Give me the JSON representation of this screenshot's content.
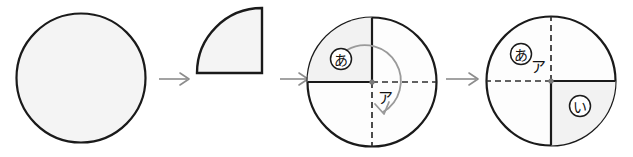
{
  "figure": {
    "background_color": "#ffffff",
    "stroke_color": "#1a1a1a",
    "dash_color": "#3a3a3a",
    "arrow_color": "#8c8c8c",
    "fill_shaded": "#f2f2f2",
    "fill_plain": "#fdfdfd"
  },
  "steps": [
    {
      "id": "step-1",
      "name": "full-circle",
      "shape": "circle",
      "shaded": true,
      "labels": []
    },
    {
      "id": "step-2",
      "name": "quarter-circle",
      "shape": "quarter-circle",
      "shaded": true,
      "corner": "bottom-right",
      "labels": []
    },
    {
      "id": "step-3",
      "name": "circle-with-shaded-top-left-quadrant",
      "shape": "circle-quadrants",
      "shaded_quadrant": "top-left",
      "solid_radii": [
        "up",
        "left"
      ],
      "dashed_radii": [
        "right",
        "down"
      ],
      "rotation_arrow": "clockwise",
      "labels": [
        {
          "text": "あ",
          "circled": true,
          "position": "top-left-quadrant"
        },
        {
          "text": "ア",
          "circled": false,
          "position": "center-below-right"
        }
      ]
    },
    {
      "id": "step-4",
      "name": "circle-with-shaded-bottom-right-quadrant",
      "shape": "circle-quadrants",
      "shaded_quadrant": "bottom-right",
      "solid_radii": [
        "right",
        "down"
      ],
      "dashed_radii": [
        "up",
        "left"
      ],
      "rotation_arrow": "none",
      "labels": [
        {
          "text": "あ",
          "circled": true,
          "position": "top-left-quadrant"
        },
        {
          "text": "ア",
          "circled": false,
          "position": "center-above-left"
        },
        {
          "text": "い",
          "circled": true,
          "position": "bottom-right-quadrant"
        }
      ]
    }
  ],
  "connectors": [
    {
      "id": "arrow-1",
      "name": "arrow-step1-to-step2",
      "glyph": "→"
    },
    {
      "id": "arrow-2",
      "name": "arrow-step2-to-step3",
      "glyph": "→"
    },
    {
      "id": "arrow-3",
      "name": "arrow-step3-to-step4",
      "glyph": "→"
    }
  ]
}
